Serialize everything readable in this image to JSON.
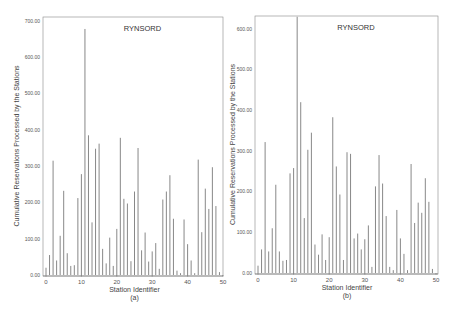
{
  "chart_data": [
    {
      "type": "bar",
      "panel_label": "(a)",
      "title": "RYNSORD",
      "xlabel": "Station Identifier",
      "ylabel": "Cumulative Reservations Processed by the Stations",
      "ylim": [
        0,
        700
      ],
      "xlim": [
        0,
        50
      ],
      "yticks": [
        "0.00",
        "100.00",
        "200.00",
        "300.00",
        "400.00",
        "500.00",
        "600.00",
        "700.00"
      ],
      "xticks": [
        "0",
        "10",
        "20",
        "30",
        "40",
        "50"
      ],
      "grid": false,
      "x": [
        0,
        1,
        2,
        3,
        4,
        5,
        6,
        7,
        8,
        9,
        10,
        11,
        12,
        13,
        14,
        15,
        16,
        17,
        18,
        19,
        20,
        21,
        22,
        23,
        24,
        25,
        26,
        27,
        28,
        29,
        30,
        31,
        32,
        33,
        34,
        35,
        36,
        37,
        38,
        39,
        40,
        41,
        42,
        43,
        44,
        45,
        46,
        47,
        48,
        49,
        50
      ],
      "values": [
        20,
        55,
        315,
        40,
        108,
        232,
        60,
        25,
        27,
        212,
        278,
        678,
        385,
        145,
        348,
        362,
        72,
        32,
        103,
        25,
        127,
        378,
        210,
        197,
        38,
        230,
        350,
        68,
        117,
        37,
        65,
        88,
        17,
        208,
        230,
        275,
        155,
        12,
        5,
        153,
        85,
        40,
        5,
        318,
        118,
        238,
        182,
        297,
        190,
        8,
        0
      ]
    },
    {
      "type": "bar",
      "panel_label": "(b)",
      "title": "RYNSORD",
      "xlabel": "Station Identifier",
      "ylabel": "Cumulative Reservations Processed by the Stations",
      "ylim": [
        0,
        630
      ],
      "xlim": [
        0,
        50
      ],
      "yticks": [
        "0.00",
        "100.00",
        "200.00",
        "300.00",
        "400.00",
        "500.00",
        "600.00"
      ],
      "xticks": [
        "0",
        "10",
        "20",
        "30",
        "40",
        "50"
      ],
      "grid": false,
      "x": [
        0,
        1,
        2,
        3,
        4,
        5,
        6,
        7,
        8,
        9,
        10,
        11,
        12,
        13,
        14,
        15,
        16,
        17,
        18,
        19,
        20,
        21,
        22,
        23,
        24,
        25,
        26,
        27,
        28,
        29,
        30,
        31,
        32,
        33,
        34,
        35,
        36,
        37,
        38,
        39,
        40,
        41,
        42,
        43,
        44,
        45,
        46,
        47,
        48,
        49,
        50
      ],
      "values": [
        18,
        58,
        322,
        53,
        110,
        217,
        53,
        30,
        32,
        245,
        258,
        630,
        420,
        135,
        303,
        345,
        70,
        45,
        95,
        32,
        88,
        383,
        262,
        193,
        32,
        297,
        293,
        85,
        97,
        58,
        83,
        117,
        15,
        213,
        290,
        220,
        140,
        15,
        7,
        155,
        85,
        47,
        7,
        268,
        123,
        173,
        148,
        233,
        175,
        10,
        0
      ]
    }
  ],
  "colors": {
    "bar": "#7a7a7a",
    "axis": "#555555",
    "frame": "#888888"
  }
}
